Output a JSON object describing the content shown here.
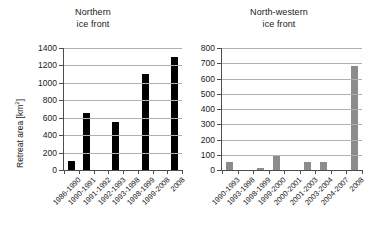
{
  "figure": {
    "ylabel": "Retreat area [km",
    "ylabel_sup": "2",
    "ylabel_close": "]"
  },
  "chart_data": [
    {
      "type": "bar",
      "title": "Northern",
      "title_line2": "ice front",
      "xlabel": "",
      "ylabel": "Retreat area [km 2]",
      "ylim": [
        0,
        1400
      ],
      "yticks": [
        0,
        200,
        400,
        600,
        800,
        1000,
        1200,
        1400
      ],
      "grid": true,
      "bar_color": "#000000",
      "categories": [
        "1986-1990",
        "1990-1991",
        "1991-1992",
        "1992-1993",
        "1993-1998",
        "1998-1999",
        "1999-2008",
        "2008"
      ],
      "values": [
        100,
        650,
        0,
        550,
        0,
        1100,
        0,
        1300
      ]
    },
    {
      "type": "bar",
      "title": "North-western",
      "title_line2": "ice front",
      "xlabel": "",
      "ylabel": "",
      "ylim": [
        0,
        800
      ],
      "yticks": [
        0,
        100,
        200,
        300,
        400,
        500,
        600,
        700,
        800
      ],
      "grid": true,
      "bar_color": "#8c8c8c",
      "categories": [
        "1990-1993",
        "1993-1998",
        "1998-1999",
        "1999-2000",
        "2000-2001",
        "2001-2003",
        "2003-2004",
        "2004-2007",
        "2008"
      ],
      "values": [
        50,
        0,
        15,
        100,
        0,
        50,
        50,
        0,
        680
      ]
    }
  ]
}
